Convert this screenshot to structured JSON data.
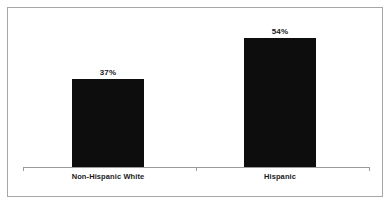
{
  "chart_data": {
    "type": "bar",
    "title": "",
    "subtitle": "",
    "xlabel": "",
    "ylabel": "",
    "categories": [
      "Non-Hispanic White",
      "Hispanic"
    ],
    "values": [
      37,
      54
    ],
    "value_labels": [
      "37%",
      "54%"
    ],
    "ylim": [
      0,
      100
    ],
    "unit": "%",
    "grid": false,
    "legend": false,
    "legend_position": "none",
    "orientation": "vertical",
    "bar_color": "#0d0d0d",
    "axis_color": "#9b9b9b",
    "border_color": "#a6a6a6",
    "background_color": "#ffffff",
    "text_color": "#1a1a1a",
    "series": [
      {
        "name": "",
        "values": [
          37,
          54
        ],
        "labels": [
          "37%",
          "54%"
        ]
      }
    ]
  }
}
